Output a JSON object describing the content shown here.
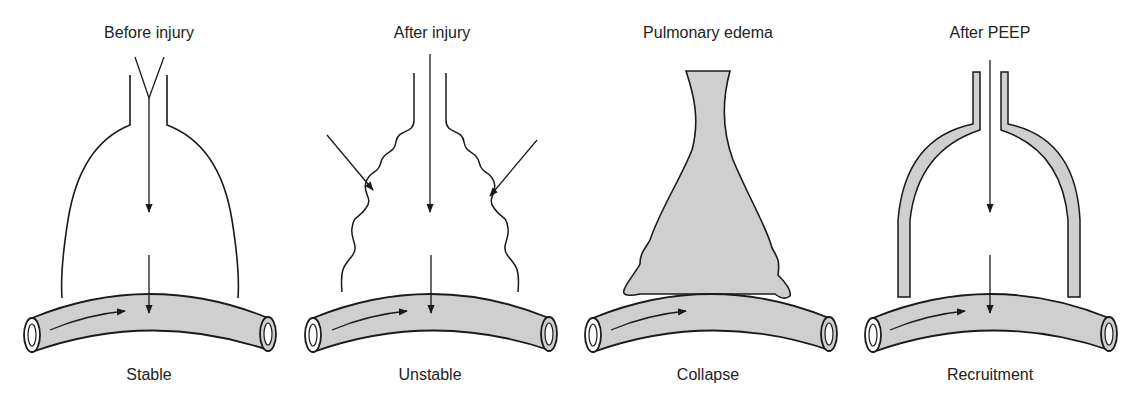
{
  "figure": {
    "panels": [
      {
        "id": "stable",
        "title": "Before injury",
        "caption": "Stable",
        "alveolus_state": "open"
      },
      {
        "id": "unstable",
        "title": "After injury",
        "caption": "Unstable",
        "alveolus_state": "crenated"
      },
      {
        "id": "collapse",
        "title": "Pulmonary edema",
        "caption": "Collapse",
        "alveolus_state": "fluid-filled"
      },
      {
        "id": "recruitment",
        "title": "After PEEP",
        "caption": "Recruitment",
        "alveolus_state": "recruited with fluid lining"
      }
    ],
    "colors": {
      "fill": "#cfcfcf",
      "stroke": "#1a1a1a",
      "background": "#ffffff"
    }
  }
}
